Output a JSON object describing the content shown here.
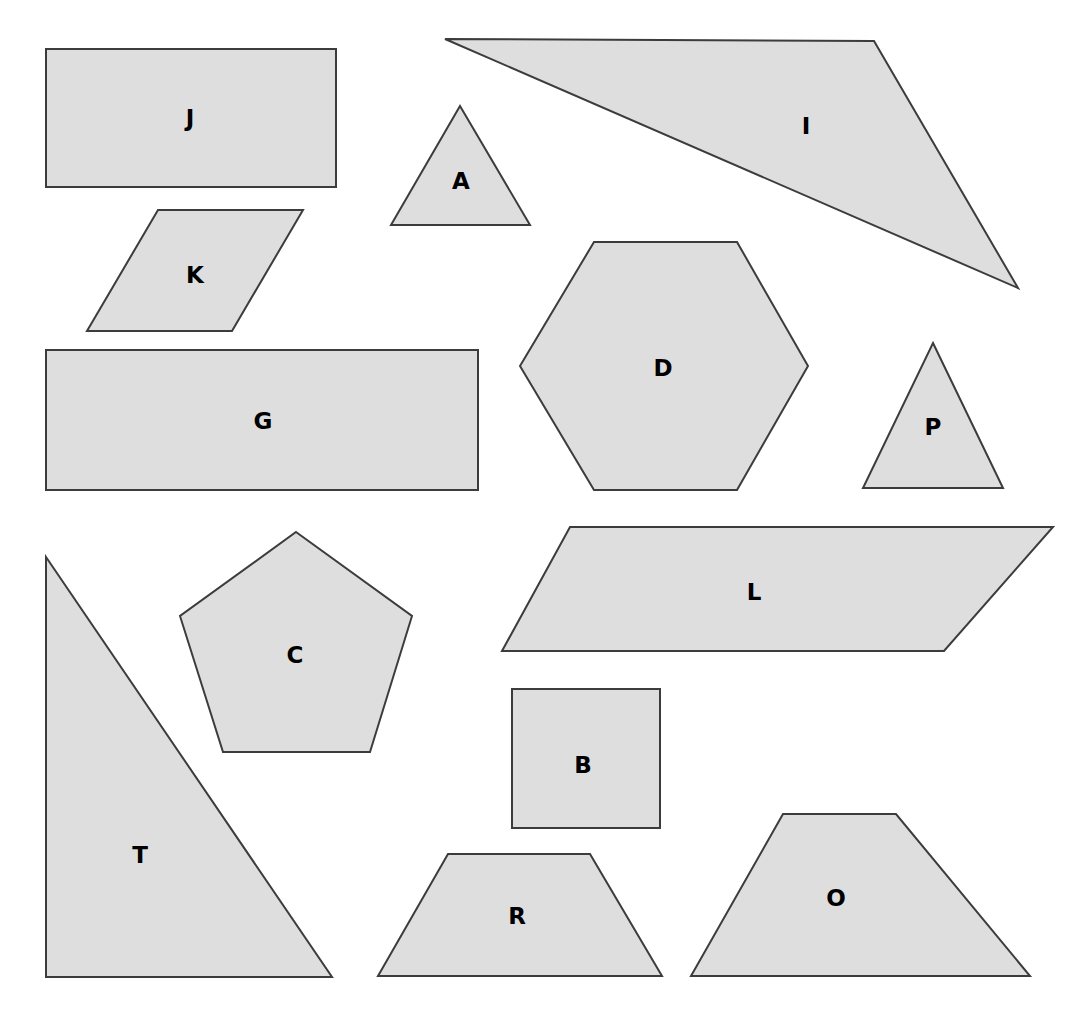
{
  "page": {
    "background_color": "#ffffff",
    "width": 1068,
    "height": 1014
  },
  "style": {
    "shape_fill_color": "#dedede",
    "shape_stroke_color": "#3c3c3c",
    "label_color": "#000000"
  },
  "chart_data": {
    "type": "diagram",
    "shape_count": 15,
    "labels": [
      "J",
      "A",
      "I",
      "K",
      "D",
      "P",
      "G",
      "T",
      "C",
      "L",
      "B",
      "R",
      "O"
    ],
    "shapes": [
      {
        "label": "J",
        "kind": "rectangle",
        "points": "46,49 336,49 336,187 46,187",
        "label_x": 190,
        "label_y": 118
      },
      {
        "label": "I",
        "kind": "triangle",
        "points": "445,39 874,41 1018,288",
        "label_x": 806,
        "label_y": 126
      },
      {
        "label": "A",
        "kind": "triangle",
        "points": "460,106 530,225 391,225",
        "label_x": 461,
        "label_y": 181
      },
      {
        "label": "K",
        "kind": "parallelogram",
        "points": "158,210 303,210 232,331 87,331",
        "label_x": 195,
        "label_y": 275
      },
      {
        "label": "D",
        "kind": "hexagon",
        "points": "594,242 737,242 808,366 737,490 594,490 520,366",
        "label_x": 663,
        "label_y": 368
      },
      {
        "label": "P",
        "kind": "triangle",
        "points": "933,343 1003,488 863,488",
        "label_x": 933,
        "label_y": 427
      },
      {
        "label": "G",
        "kind": "rectangle",
        "points": "46,350 478,350 478,490 46,490",
        "label_x": 263,
        "label_y": 421
      },
      {
        "label": "T",
        "kind": "triangle",
        "points": "46,557 332,977 46,977",
        "label_x": 140,
        "label_y": 855
      },
      {
        "label": "C",
        "kind": "pentagon",
        "points": "296,532 412,616 370,752 223,752 180,616",
        "label_x": 295,
        "label_y": 655
      },
      {
        "label": "L",
        "kind": "parallelogram",
        "points": "570,527 1053,527 944,651 502,651",
        "label_x": 754,
        "label_y": 592
      },
      {
        "label": "B",
        "kind": "square",
        "points": "512,689 660,689 660,828 512,828",
        "label_x": 583,
        "label_y": 765
      },
      {
        "label": "R",
        "kind": "trapezoid",
        "points": "448,854 590,854 662,976 378,976",
        "label_x": 517,
        "label_y": 916
      },
      {
        "label": "O",
        "kind": "trapezoid",
        "points": "783,814 896,814 1030,976 691,976",
        "label_x": 836,
        "label_y": 898
      }
    ]
  }
}
